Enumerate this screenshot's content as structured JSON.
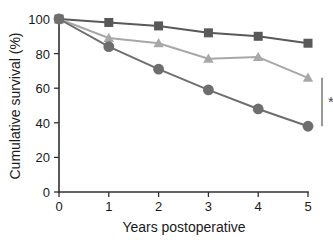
{
  "chart_data": {
    "type": "line",
    "title": "",
    "xlabel": "Years postoperative",
    "ylabel": "Cumulative survival (%)",
    "x": [
      0,
      1,
      2,
      3,
      4,
      5
    ],
    "xlim": [
      0,
      5
    ],
    "ylim": [
      0,
      100
    ],
    "xticks": [
      "0",
      "1",
      "2",
      "3",
      "4",
      "5"
    ],
    "yticks": [
      "0",
      "20",
      "40",
      "60",
      "80",
      "100"
    ],
    "grid": false,
    "legend_position": "none",
    "series": [
      {
        "name": "series-squares",
        "marker": "square",
        "color": "#595959",
        "values": [
          100,
          98,
          96,
          92,
          90,
          86
        ]
      },
      {
        "name": "series-triangles",
        "marker": "triangle",
        "color": "#a8a8a8",
        "values": [
          100,
          89,
          86,
          77,
          78,
          66
        ]
      },
      {
        "name": "series-circles",
        "marker": "circle",
        "color": "#6e6e6e",
        "values": [
          100,
          84,
          71,
          59,
          48,
          38
        ]
      }
    ],
    "annotations": [
      {
        "name": "significance-bracket",
        "label": "*",
        "x": 5,
        "y_top": 66,
        "y_bottom": 38,
        "color": "#6e6e6e"
      }
    ]
  },
  "axes": {
    "y_label": "Cumulative survival (%)",
    "x_label": "Years postoperative",
    "y_tick_labels": [
      "100",
      "80",
      "60",
      "40",
      "20",
      "0"
    ],
    "x_tick_labels": [
      "0",
      "1",
      "2",
      "3",
      "4",
      "5"
    ]
  },
  "annotation": {
    "asterisk": "*"
  },
  "colors": {
    "axis": "#303030",
    "series_square": "#595959",
    "series_triangle": "#a8a8a8",
    "series_circle": "#6e6e6e",
    "bracket": "#6e6e6e",
    "background": "#ffffff"
  }
}
